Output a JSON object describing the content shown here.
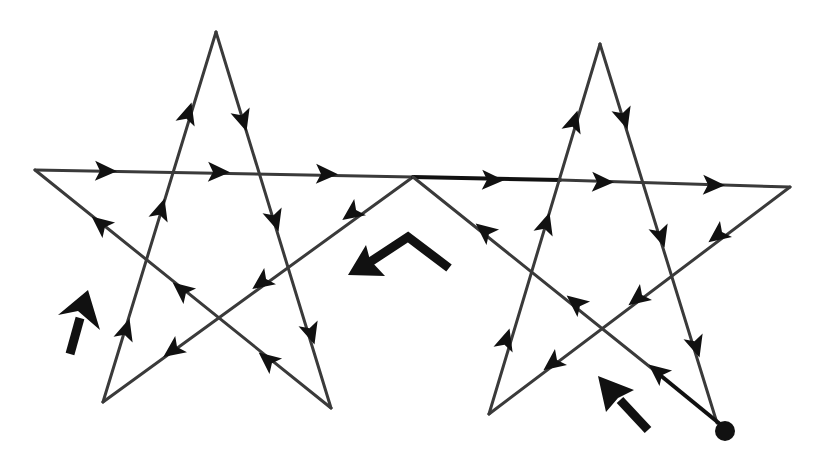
{
  "diagram": {
    "title": "",
    "colors": {
      "line": "#3a3a3a",
      "arrow": "#111111",
      "background": "#ffffff"
    },
    "stars": [
      {
        "id": "left-star",
        "points": {
          "top": [
            216,
            32
          ],
          "left": [
            35,
            170
          ],
          "right": [
            415,
            177
          ],
          "bottom_left": [
            103,
            402
          ],
          "bottom_right": [
            331,
            408
          ]
        }
      },
      {
        "id": "right-star",
        "points": {
          "top": [
            600,
            44
          ],
          "left": [
            413,
            177
          ],
          "right": [
            790,
            187
          ],
          "bottom_left": [
            489,
            414
          ],
          "bottom_right": [
            717,
            423
          ]
        }
      }
    ],
    "start_dot": {
      "x": 725,
      "y": 431,
      "r": 10
    },
    "big_arrows": [
      {
        "id": "left-up-arrow",
        "direction": "up"
      },
      {
        "id": "center-chevron-arrow",
        "direction": "down-left"
      },
      {
        "id": "right-up-left-arrow",
        "direction": "up-left"
      }
    ],
    "labels": []
  }
}
